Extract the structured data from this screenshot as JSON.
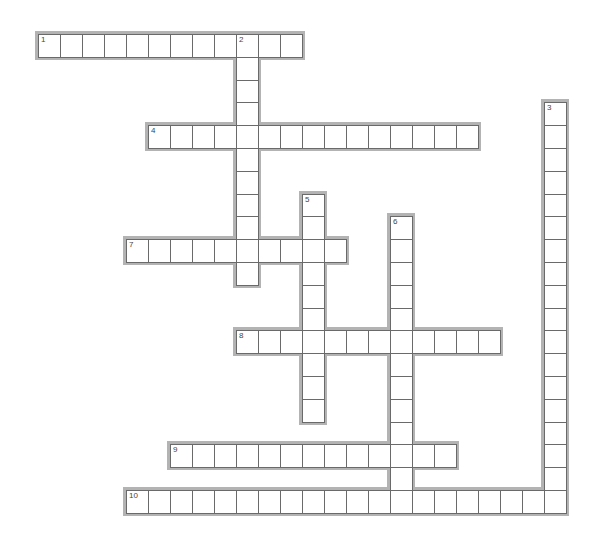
{
  "puzzle": {
    "type": "crossword",
    "grid": {
      "origin_x": 38,
      "origin_y": 34,
      "cell_w": 22,
      "cell_h": 22.8
    },
    "colors": {
      "frame": "#b3b3b3",
      "cell_border": "#6a6a6a",
      "cell_bg": "#ffffff",
      "number": "#444444"
    },
    "entries": [
      {
        "number": "1",
        "direction": "across",
        "row": 0,
        "col": 4,
        "length": 12,
        "offset_col": -4
      },
      {
        "number": "2",
        "direction": "down",
        "row": 0,
        "col": 9,
        "length": 11
      },
      {
        "number": "3",
        "direction": "down",
        "row": 3,
        "col": 23,
        "length": 18
      },
      {
        "number": "4",
        "direction": "across",
        "row": 4,
        "col": 5,
        "length": 15
      },
      {
        "number": "5",
        "direction": "down",
        "row": 7,
        "col": 12,
        "length": 10
      },
      {
        "number": "6",
        "direction": "down",
        "row": 8,
        "col": 16,
        "length": 13
      },
      {
        "number": "7",
        "direction": "across",
        "row": 9,
        "col": 4,
        "length": 10
      },
      {
        "number": "8",
        "direction": "across",
        "row": 13,
        "col": 9,
        "length": 12
      },
      {
        "number": "9",
        "direction": "across",
        "row": 18,
        "col": 6,
        "length": 13
      },
      {
        "number": "10",
        "direction": "across",
        "row": 20,
        "col": 4,
        "length": 20
      }
    ]
  }
}
